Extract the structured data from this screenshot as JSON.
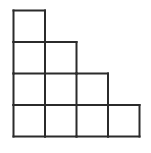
{
  "figure": {
    "background_color": "#ffffff",
    "line_color": "#2b2b2b",
    "line_width": 2,
    "cell_size": 31.5,
    "origin_x": 13.5,
    "origin_y": 10.5,
    "rows": 4,
    "columns": 4,
    "total_cells": 10,
    "row_cell_counts": [
      1,
      2,
      3,
      4
    ],
    "cells": [
      {
        "row": 0,
        "col": 0
      },
      {
        "row": 1,
        "col": 0
      },
      {
        "row": 1,
        "col": 1
      },
      {
        "row": 2,
        "col": 0
      },
      {
        "row": 2,
        "col": 1
      },
      {
        "row": 2,
        "col": 2
      },
      {
        "row": 3,
        "col": 0
      },
      {
        "row": 3,
        "col": 1
      },
      {
        "row": 3,
        "col": 2
      },
      {
        "row": 3,
        "col": 3
      }
    ]
  }
}
